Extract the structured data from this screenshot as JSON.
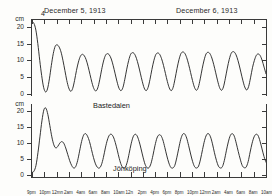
{
  "header": {
    "date_left": "December 5, 1913",
    "date_right": "December 6, 1913",
    "peak_annotation": "4"
  },
  "axes": {
    "unit": "cm",
    "y_ticks": [
      "20",
      "15",
      "10",
      "5",
      "0"
    ],
    "y_values": [
      20,
      15,
      10,
      5,
      0
    ],
    "y_unit_label": "cm",
    "time_ticks": [
      "9pm",
      "10pm",
      "12mn",
      "2am",
      "4am",
      "6am",
      "8am",
      "10am",
      "12n",
      "2pm",
      "4pm",
      "6pm",
      "8pm",
      "10pm",
      "12mn",
      "2am",
      "4am",
      "6am",
      "8am",
      "10am"
    ]
  },
  "series_labels": {
    "upper": "Bastedalen",
    "lower": "Jönköping"
  },
  "chart_data": {
    "type": "line",
    "title": "",
    "xlabel": "",
    "ylabel": "cm",
    "grid": false,
    "legend_position": "inline",
    "panels": [
      {
        "name": "Bastedalen",
        "ylim": [
          0,
          22
        ],
        "yticks": [
          0,
          5,
          10,
          15,
          20
        ],
        "description": "Seiche oscillation record; initial sharp drop from 22 cm then regular damped oscillations",
        "x": [
          0,
          1,
          2,
          3,
          4,
          5,
          6,
          7,
          8,
          9,
          10,
          11,
          12,
          13,
          14,
          15,
          16,
          17,
          18,
          19,
          20,
          21,
          22,
          23,
          24,
          25,
          26,
          27,
          28,
          29,
          30,
          31,
          32,
          33,
          34,
          35,
          36,
          37,
          38,
          39,
          40,
          41,
          42,
          43,
          44,
          45,
          46,
          47,
          48,
          49,
          50,
          51,
          52,
          53,
          54,
          55,
          56,
          57,
          58,
          59,
          60,
          61,
          62,
          63,
          64,
          65,
          66,
          67,
          68,
          69,
          70,
          71,
          72,
          73,
          74,
          75,
          76,
          77,
          78,
          79,
          80,
          81,
          82,
          83,
          84,
          85,
          86,
          87,
          88,
          89,
          90,
          91,
          92,
          93,
          94,
          95,
          96,
          97,
          98,
          99,
          100,
          101,
          102,
          103,
          104,
          105,
          106,
          107,
          108,
          109,
          110,
          111,
          112,
          113,
          114,
          115,
          116,
          117,
          118,
          119
        ],
        "values": [
          21.5,
          21.0,
          19.0,
          15.0,
          10.0,
          5.5,
          2.0,
          0.6,
          1.5,
          4.5,
          8.5,
          12.0,
          14.2,
          14.6,
          14.0,
          12.5,
          10.0,
          7.0,
          4.0,
          1.8,
          0.8,
          1.6,
          4.0,
          7.0,
          9.5,
          11.2,
          11.8,
          11.4,
          10.2,
          8.2,
          5.8,
          3.4,
          1.6,
          0.9,
          1.8,
          4.2,
          7.2,
          9.8,
          11.5,
          12.0,
          11.6,
          10.4,
          8.4,
          6.0,
          3.6,
          1.7,
          1.0,
          1.9,
          4.4,
          7.4,
          10.0,
          11.8,
          12.3,
          11.9,
          10.6,
          8.6,
          6.2,
          3.8,
          1.8,
          1.0,
          1.9,
          4.3,
          7.3,
          9.9,
          11.7,
          12.2,
          11.8,
          10.5,
          8.5,
          6.1,
          3.7,
          1.8,
          1.0,
          2.0,
          4.6,
          7.6,
          10.2,
          12.0,
          12.5,
          12.1,
          10.8,
          8.8,
          6.4,
          4.0,
          2.0,
          1.1,
          2.0,
          4.5,
          7.5,
          10.1,
          11.9,
          12.4,
          12.0,
          10.7,
          8.7,
          6.3,
          3.9,
          1.9,
          1.1,
          2.1,
          4.7,
          7.7,
          10.3,
          12.1,
          12.6,
          12.2,
          10.9,
          8.9,
          6.5,
          4.1,
          2.1,
          1.2,
          2.2,
          4.8,
          7.8,
          10.0,
          11.5,
          11.9,
          11.4,
          10.0,
          8.0,
          6.0
        ]
      },
      {
        "name": "Jönköping",
        "ylim": [
          0,
          22
        ],
        "yticks": [
          0,
          5,
          10,
          15,
          20
        ],
        "description": "Seiche oscillation record; sharp initial spike to 21 cm then sustained oscillations with spiky crests",
        "x": [
          0,
          1,
          2,
          3,
          4,
          5,
          6,
          7,
          8,
          9,
          10,
          11,
          12,
          13,
          14,
          15,
          16,
          17,
          18,
          19,
          20,
          21,
          22,
          23,
          24,
          25,
          26,
          27,
          28,
          29,
          30,
          31,
          32,
          33,
          34,
          35,
          36,
          37,
          38,
          39,
          40,
          41,
          42,
          43,
          44,
          45,
          46,
          47,
          48,
          49,
          50,
          51,
          52,
          53,
          54,
          55,
          56,
          57,
          58,
          59,
          60,
          61,
          62,
          63,
          64,
          65,
          66,
          67,
          68,
          69,
          70,
          71,
          72,
          73,
          74,
          75,
          76,
          77,
          78,
          79,
          80,
          81,
          82,
          83,
          84,
          85,
          86,
          87,
          88,
          89,
          90,
          91,
          92,
          93,
          94,
          95,
          96,
          97,
          98,
          99,
          100,
          101,
          102,
          103,
          104,
          105,
          106,
          107,
          108,
          109,
          110,
          111,
          112,
          113,
          114,
          115,
          116,
          117,
          118,
          119
        ],
        "values": [
          0.8,
          1.2,
          3.0,
          7.0,
          12.0,
          17.0,
          20.5,
          21.0,
          19.0,
          15.5,
          12.0,
          9.5,
          8.5,
          9.0,
          10.0,
          10.5,
          10.0,
          8.5,
          6.5,
          4.5,
          3.0,
          2.2,
          2.6,
          4.5,
          7.5,
          10.5,
          12.5,
          13.0,
          12.2,
          10.5,
          8.0,
          5.5,
          3.5,
          2.4,
          2.2,
          3.2,
          5.5,
          8.5,
          11.0,
          12.5,
          12.8,
          12.0,
          10.2,
          7.8,
          5.2,
          3.2,
          2.2,
          2.4,
          4.0,
          6.8,
          9.8,
          12.0,
          12.8,
          12.3,
          10.6,
          8.2,
          5.6,
          3.4,
          2.3,
          2.3,
          3.6,
          6.2,
          9.2,
          11.6,
          12.6,
          12.4,
          11.0,
          8.6,
          6.0,
          3.8,
          2.4,
          2.2,
          3.0,
          5.4,
          8.4,
          11.2,
          12.8,
          12.9,
          11.6,
          9.2,
          6.6,
          4.2,
          2.6,
          2.2,
          2.8,
          5.0,
          8.0,
          10.8,
          12.6,
          13.0,
          12.0,
          9.8,
          7.0,
          4.6,
          2.8,
          2.2,
          2.6,
          4.6,
          7.6,
          10.4,
          12.4,
          13.0,
          12.2,
          10.0,
          7.4,
          5.0,
          3.0,
          2.3,
          2.5,
          4.2,
          7.2,
          10.0,
          12.0,
          12.8,
          12.4,
          10.6,
          8.2,
          5.8,
          4.0
        ]
      }
    ]
  }
}
